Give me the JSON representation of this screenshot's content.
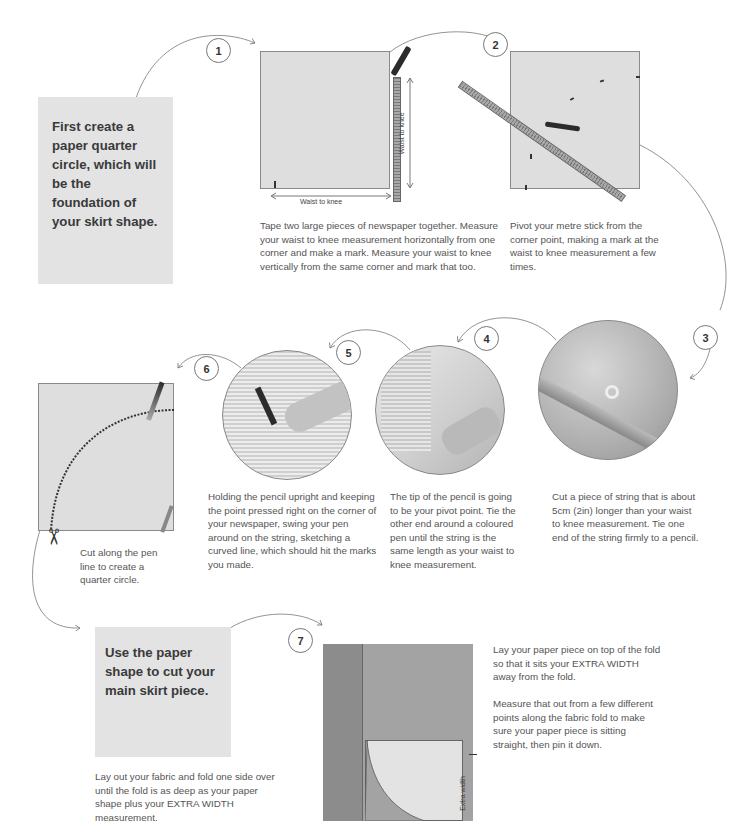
{
  "section1": {
    "intro": "First create a paper quarter circle, which will be the foundation of your skirt shape."
  },
  "steps": [
    {
      "number": "1",
      "text": "Tape two large pieces of newspaper together. Measure your waist to knee measurement horizontally from one corner and make a mark. Measure your waist to knee vertically from the same corner and mark that too.",
      "labels": {
        "horizontal": "Waist to knee",
        "vertical": "Waist to knee"
      }
    },
    {
      "number": "2",
      "text": "Pivot your metre stick from the corner point, making a mark at the waist to knee measurement a few times."
    },
    {
      "number": "3",
      "text": "Cut a piece of string that is about 5cm (2in) longer than your waist to knee measurement. Tie one end of the string firmly to a pencil."
    },
    {
      "number": "4",
      "text": "The tip of the pencil is going to be your pivot point. Tie the other end around a coloured pen until the string is the same length as your waist to knee measurement."
    },
    {
      "number": "5",
      "text": "Holding the pencil upright and keeping the point pressed right on the corner of your newspaper, swing your pen around on the string, sketching a curved line, which should hit the marks you made."
    },
    {
      "number": "6",
      "text": "Cut along the pen line to create a quarter circle."
    },
    {
      "number": "7",
      "text_1": "Lay your paper piece on top of the fold so that it sits your EXTRA WIDTH away from the fold.",
      "text_2": "Measure that out from a few different points along the fabric fold to make sure your paper piece is sitting straight, then pin it down.",
      "labels": {
        "extra_width": "Extra width"
      }
    }
  ],
  "section2": {
    "intro": "Use the paper shape to cut your main skirt piece.",
    "text": "Lay out your fabric and fold one side over until the fold is as deep as your paper shape plus your EXTRA WIDTH measurement."
  },
  "icons": {
    "scissors": "scissors-icon"
  },
  "colors": {
    "paper": "#dedede",
    "intro_box": "#e3e3e3",
    "fabric": "#8c8c8c",
    "text": "#555555"
  }
}
